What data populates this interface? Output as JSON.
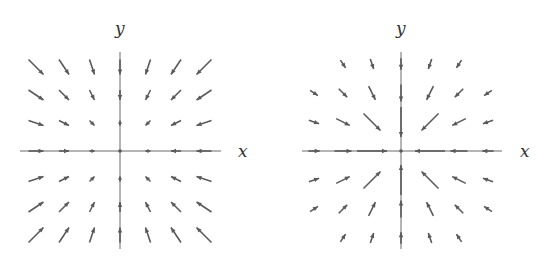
{
  "figure": {
    "panels": [
      {
        "id": "left",
        "description": "Linear inward vector field F(x,y) = -(x, y); arrow length grows with distance from origin",
        "field": "linear-sink",
        "x_label": "x",
        "y_label": "y",
        "grid_range": [
          -3,
          3
        ],
        "omit_points": [],
        "color": "#5a5a5a"
      },
      {
        "id": "right",
        "description": "Inward radial vector field F = -r_hat / r; arrow length shrinks with distance from origin",
        "field": "inverse-sink",
        "x_label": "x",
        "y_label": "y",
        "grid_range": [
          -3,
          3
        ],
        "omit_points": [
          [
            -3,
            3
          ],
          [
            3,
            3
          ],
          [
            -3,
            -3
          ],
          [
            3,
            -3
          ]
        ],
        "color": "#5a5a5a"
      }
    ]
  }
}
